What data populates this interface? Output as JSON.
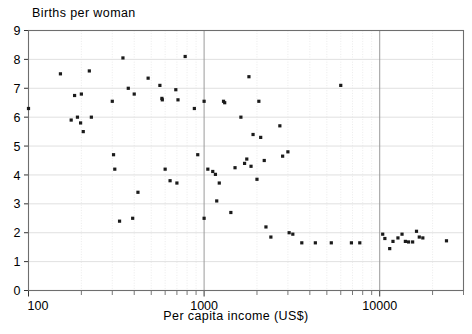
{
  "chart_data": {
    "type": "scatter",
    "title": "",
    "ylabel": "Births per woman",
    "xlabel": "Per capita income (US$)",
    "xscale": "log",
    "yscale": "linear",
    "xlim": [
      100,
      30000
    ],
    "ylim": [
      0,
      9
    ],
    "grid": true,
    "legend": null,
    "x_major_ticks": [
      100,
      1000,
      10000
    ],
    "x_major_tick_labels": [
      "100",
      "1000",
      "10000"
    ],
    "x_minor_ticks": [
      200,
      300,
      400,
      500,
      600,
      700,
      800,
      900,
      2000,
      3000,
      4000,
      5000,
      6000,
      7000,
      8000,
      9000,
      20000,
      30000
    ],
    "y_ticks": [
      0,
      1,
      2,
      3,
      4,
      5,
      6,
      7,
      8,
      9
    ],
    "y_tick_labels": [
      "0",
      "1",
      "2",
      "3",
      "4",
      "5",
      "6",
      "7",
      "8",
      "9"
    ],
    "marker": "square",
    "marker_color": "#1a1a1a",
    "marker_size": 3.2,
    "points": [
      {
        "x": 100,
        "y": 6.3
      },
      {
        "x": 152,
        "y": 7.5
      },
      {
        "x": 175,
        "y": 5.9
      },
      {
        "x": 183,
        "y": 6.75
      },
      {
        "x": 190,
        "y": 6.0
      },
      {
        "x": 198,
        "y": 5.8
      },
      {
        "x": 200,
        "y": 6.8
      },
      {
        "x": 205,
        "y": 5.5
      },
      {
        "x": 222,
        "y": 7.6
      },
      {
        "x": 228,
        "y": 6.0
      },
      {
        "x": 300,
        "y": 6.55
      },
      {
        "x": 305,
        "y": 4.7
      },
      {
        "x": 310,
        "y": 4.2
      },
      {
        "x": 330,
        "y": 2.4
      },
      {
        "x": 345,
        "y": 8.05
      },
      {
        "x": 370,
        "y": 7.0
      },
      {
        "x": 392,
        "y": 2.5
      },
      {
        "x": 400,
        "y": 6.8
      },
      {
        "x": 420,
        "y": 3.4
      },
      {
        "x": 480,
        "y": 7.35
      },
      {
        "x": 560,
        "y": 7.1
      },
      {
        "x": 575,
        "y": 6.65
      },
      {
        "x": 578,
        "y": 6.6
      },
      {
        "x": 600,
        "y": 4.2
      },
      {
        "x": 640,
        "y": 3.8
      },
      {
        "x": 690,
        "y": 6.95
      },
      {
        "x": 700,
        "y": 3.72
      },
      {
        "x": 710,
        "y": 6.6
      },
      {
        "x": 780,
        "y": 8.1
      },
      {
        "x": 880,
        "y": 6.3
      },
      {
        "x": 920,
        "y": 4.7
      },
      {
        "x": 1000,
        "y": 6.55
      },
      {
        "x": 1000,
        "y": 2.5
      },
      {
        "x": 1050,
        "y": 4.2
      },
      {
        "x": 1120,
        "y": 4.12
      },
      {
        "x": 1160,
        "y": 4.02
      },
      {
        "x": 1180,
        "y": 3.1
      },
      {
        "x": 1220,
        "y": 3.72
      },
      {
        "x": 1290,
        "y": 6.55
      },
      {
        "x": 1310,
        "y": 6.5
      },
      {
        "x": 1420,
        "y": 2.7
      },
      {
        "x": 1500,
        "y": 4.25
      },
      {
        "x": 1620,
        "y": 6.0
      },
      {
        "x": 1700,
        "y": 4.4
      },
      {
        "x": 1750,
        "y": 4.55
      },
      {
        "x": 1800,
        "y": 7.4
      },
      {
        "x": 1850,
        "y": 4.3
      },
      {
        "x": 1900,
        "y": 5.4
      },
      {
        "x": 2000,
        "y": 3.85
      },
      {
        "x": 2050,
        "y": 6.55
      },
      {
        "x": 2100,
        "y": 5.3
      },
      {
        "x": 2200,
        "y": 4.5
      },
      {
        "x": 2250,
        "y": 2.2
      },
      {
        "x": 2400,
        "y": 1.85
      },
      {
        "x": 2700,
        "y": 5.7
      },
      {
        "x": 2800,
        "y": 4.65
      },
      {
        "x": 3000,
        "y": 4.8
      },
      {
        "x": 3050,
        "y": 2.0
      },
      {
        "x": 3200,
        "y": 1.95
      },
      {
        "x": 3600,
        "y": 1.65
      },
      {
        "x": 4300,
        "y": 1.65
      },
      {
        "x": 5300,
        "y": 1.65
      },
      {
        "x": 6000,
        "y": 7.1
      },
      {
        "x": 6900,
        "y": 1.65
      },
      {
        "x": 7700,
        "y": 1.65
      },
      {
        "x": 10400,
        "y": 1.95
      },
      {
        "x": 10700,
        "y": 1.8
      },
      {
        "x": 11400,
        "y": 1.45
      },
      {
        "x": 11900,
        "y": 1.7
      },
      {
        "x": 12700,
        "y": 1.82
      },
      {
        "x": 13400,
        "y": 1.95
      },
      {
        "x": 14000,
        "y": 1.7
      },
      {
        "x": 14600,
        "y": 1.68
      },
      {
        "x": 15400,
        "y": 1.68
      },
      {
        "x": 16200,
        "y": 2.05
      },
      {
        "x": 16800,
        "y": 1.85
      },
      {
        "x": 17600,
        "y": 1.82
      },
      {
        "x": 24000,
        "y": 1.72
      }
    ]
  }
}
